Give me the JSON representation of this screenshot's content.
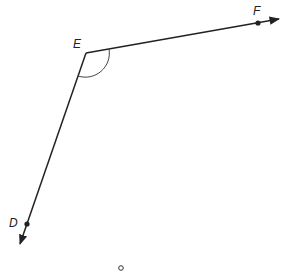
{
  "diagram": {
    "type": "angle",
    "labels": {
      "vertex": "E",
      "ray1_point": "F",
      "ray2_point": "D"
    },
    "colors": {
      "stroke": "#222222",
      "background": "#ffffff"
    },
    "angle_mark": "arc",
    "footer_marker": "o"
  }
}
